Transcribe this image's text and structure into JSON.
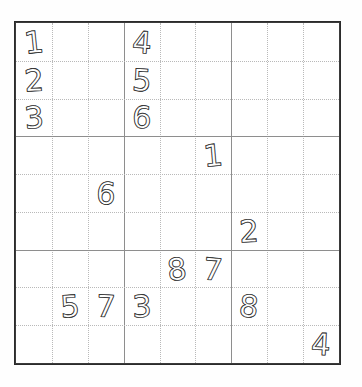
{
  "page": {
    "background_color": "#fefefe",
    "width": 362,
    "height": 387
  },
  "grid": {
    "name": "sudoku-grid",
    "rows": 9,
    "columns": 9,
    "box_rows": 3,
    "box_columns": 3,
    "border_color": "#2b2b2b",
    "gridline_color": "#b9b9b9",
    "box_line_color": "#8e8e8e",
    "digit_color": "#1a1a1a",
    "digit_style": "hand-drawn outline",
    "origin_x": 14,
    "origin_y": 21,
    "grid_width": 327,
    "grid_height": 344,
    "cell_width": 36.33,
    "cell_height": 38.22
  },
  "cells": [
    {
      "row": 1,
      "col": 1,
      "value": "1"
    },
    {
      "row": 1,
      "col": 2,
      "value": ""
    },
    {
      "row": 1,
      "col": 3,
      "value": ""
    },
    {
      "row": 1,
      "col": 4,
      "value": "4"
    },
    {
      "row": 1,
      "col": 5,
      "value": ""
    },
    {
      "row": 1,
      "col": 6,
      "value": ""
    },
    {
      "row": 1,
      "col": 7,
      "value": ""
    },
    {
      "row": 1,
      "col": 8,
      "value": ""
    },
    {
      "row": 1,
      "col": 9,
      "value": ""
    },
    {
      "row": 2,
      "col": 1,
      "value": "2"
    },
    {
      "row": 2,
      "col": 2,
      "value": ""
    },
    {
      "row": 2,
      "col": 3,
      "value": ""
    },
    {
      "row": 2,
      "col": 4,
      "value": "5"
    },
    {
      "row": 2,
      "col": 5,
      "value": ""
    },
    {
      "row": 2,
      "col": 6,
      "value": ""
    },
    {
      "row": 2,
      "col": 7,
      "value": ""
    },
    {
      "row": 2,
      "col": 8,
      "value": ""
    },
    {
      "row": 2,
      "col": 9,
      "value": ""
    },
    {
      "row": 3,
      "col": 1,
      "value": "3"
    },
    {
      "row": 3,
      "col": 2,
      "value": ""
    },
    {
      "row": 3,
      "col": 3,
      "value": ""
    },
    {
      "row": 3,
      "col": 4,
      "value": "6"
    },
    {
      "row": 3,
      "col": 5,
      "value": ""
    },
    {
      "row": 3,
      "col": 6,
      "value": ""
    },
    {
      "row": 3,
      "col": 7,
      "value": ""
    },
    {
      "row": 3,
      "col": 8,
      "value": ""
    },
    {
      "row": 3,
      "col": 9,
      "value": ""
    },
    {
      "row": 4,
      "col": 1,
      "value": ""
    },
    {
      "row": 4,
      "col": 2,
      "value": ""
    },
    {
      "row": 4,
      "col": 3,
      "value": ""
    },
    {
      "row": 4,
      "col": 4,
      "value": ""
    },
    {
      "row": 4,
      "col": 5,
      "value": ""
    },
    {
      "row": 4,
      "col": 6,
      "value": "1"
    },
    {
      "row": 4,
      "col": 7,
      "value": ""
    },
    {
      "row": 4,
      "col": 8,
      "value": ""
    },
    {
      "row": 4,
      "col": 9,
      "value": ""
    },
    {
      "row": 5,
      "col": 1,
      "value": ""
    },
    {
      "row": 5,
      "col": 2,
      "value": ""
    },
    {
      "row": 5,
      "col": 3,
      "value": "6"
    },
    {
      "row": 5,
      "col": 4,
      "value": ""
    },
    {
      "row": 5,
      "col": 5,
      "value": ""
    },
    {
      "row": 5,
      "col": 6,
      "value": ""
    },
    {
      "row": 5,
      "col": 7,
      "value": ""
    },
    {
      "row": 5,
      "col": 8,
      "value": ""
    },
    {
      "row": 5,
      "col": 9,
      "value": ""
    },
    {
      "row": 6,
      "col": 1,
      "value": ""
    },
    {
      "row": 6,
      "col": 2,
      "value": ""
    },
    {
      "row": 6,
      "col": 3,
      "value": ""
    },
    {
      "row": 6,
      "col": 4,
      "value": ""
    },
    {
      "row": 6,
      "col": 5,
      "value": ""
    },
    {
      "row": 6,
      "col": 6,
      "value": ""
    },
    {
      "row": 6,
      "col": 7,
      "value": "2"
    },
    {
      "row": 6,
      "col": 8,
      "value": ""
    },
    {
      "row": 6,
      "col": 9,
      "value": ""
    },
    {
      "row": 7,
      "col": 1,
      "value": ""
    },
    {
      "row": 7,
      "col": 2,
      "value": ""
    },
    {
      "row": 7,
      "col": 3,
      "value": ""
    },
    {
      "row": 7,
      "col": 4,
      "value": ""
    },
    {
      "row": 7,
      "col": 5,
      "value": ""
    },
    {
      "row": 7,
      "col": 6,
      "value": ""
    },
    {
      "row": 7,
      "col": 7,
      "value": ""
    },
    {
      "row": 7,
      "col": 8,
      "value": ""
    },
    {
      "row": 7,
      "col": 9,
      "value": ""
    },
    {
      "row": 8,
      "col": 1,
      "value": ""
    },
    {
      "row": 8,
      "col": 2,
      "value": ""
    },
    {
      "row": 8,
      "col": 3,
      "value": ""
    },
    {
      "row": 8,
      "col": 4,
      "value": ""
    },
    {
      "row": 8,
      "col": 5,
      "value": "8"
    },
    {
      "row": 8,
      "col": 6,
      "value": "7"
    },
    {
      "row": 8,
      "col": 7,
      "value": ""
    },
    {
      "row": 8,
      "col": 8,
      "value": ""
    },
    {
      "row": 8,
      "col": 9,
      "value": ""
    },
    {
      "row": 9,
      "col": 1,
      "value": ""
    },
    {
      "row": 9,
      "col": 2,
      "value": ""
    },
    {
      "row": 9,
      "col": 3,
      "value": ""
    },
    {
      "row": 9,
      "col": 4,
      "value": ""
    },
    {
      "row": 9,
      "col": 5,
      "value": ""
    },
    {
      "row": 9,
      "col": 6,
      "value": ""
    },
    {
      "row": 9,
      "col": 7,
      "value": ""
    },
    {
      "row": 9,
      "col": 8,
      "value": ""
    },
    {
      "row": 9,
      "col": 9,
      "value": ""
    }
  ],
  "extra_cells": [
    {
      "row": 9,
      "col": 2,
      "value": "5"
    },
    {
      "row": 9,
      "col": 3,
      "value": "7"
    },
    {
      "row": 9,
      "col": 4,
      "value": "3"
    },
    {
      "row": 9,
      "col": 7,
      "value": "8"
    },
    {
      "row": 10,
      "col": 9,
      "value": "4"
    }
  ],
  "filled_digits": [
    {
      "name": "digit-1-r1c1",
      "value": "1",
      "row": 1,
      "col": 1,
      "rotate": -6
    },
    {
      "name": "digit-4-r1c4",
      "value": "4",
      "row": 1,
      "col": 4,
      "rotate": 4
    },
    {
      "name": "digit-2-r2c1",
      "value": "2",
      "row": 2,
      "col": 1,
      "rotate": -4
    },
    {
      "name": "digit-5-r2c4",
      "value": "5",
      "row": 2,
      "col": 4,
      "rotate": 3
    },
    {
      "name": "digit-3-r3c1",
      "value": "3",
      "row": 3,
      "col": 1,
      "rotate": -5
    },
    {
      "name": "digit-6-r3c4",
      "value": "6",
      "row": 3,
      "col": 4,
      "rotate": 2
    },
    {
      "name": "digit-1-r4c6",
      "value": "1",
      "row": 4,
      "col": 6,
      "rotate": -5
    },
    {
      "name": "digit-6-r5c3",
      "value": "6",
      "row": 5,
      "col": 3,
      "rotate": 4
    },
    {
      "name": "digit-2-r6c7",
      "value": "2",
      "row": 6,
      "col": 7,
      "rotate": -3
    },
    {
      "name": "digit-8-r7c5",
      "value": "8",
      "row": 7,
      "col": 5,
      "rotate": -6
    },
    {
      "name": "digit-7-r7c6",
      "value": "7",
      "row": 7,
      "col": 6,
      "rotate": 5
    },
    {
      "name": "digit-5-r8c2",
      "value": "5",
      "row": 8,
      "col": 2,
      "rotate": -4
    },
    {
      "name": "digit-7-r8c3",
      "value": "7",
      "row": 8,
      "col": 3,
      "rotate": 3
    },
    {
      "name": "digit-3-r8c4",
      "value": "3",
      "row": 8,
      "col": 4,
      "rotate": -2
    },
    {
      "name": "digit-8-r8c7",
      "value": "8",
      "row": 8,
      "col": 7,
      "rotate": 6
    },
    {
      "name": "digit-4-r9c9",
      "value": "4",
      "row": 9,
      "col": 9,
      "rotate": 3
    }
  ]
}
